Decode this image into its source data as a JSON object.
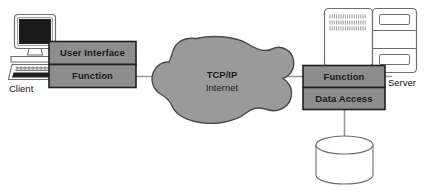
{
  "diagram": {
    "background_color": "#ffffff",
    "colors": {
      "cloud_fill": "#9a9a9a",
      "cloud_stroke": "#4a4a4a",
      "box_fill": "#8d8d8d",
      "box_stroke": "#1f1f1f",
      "line": "#9a9a9a",
      "outline": "#6e6e6e",
      "screen": "#1a1a1a",
      "text": "#111111"
    }
  },
  "client": {
    "label": "Client",
    "icon": "desktop-computer-icon",
    "tiers": [
      {
        "id": "user-interface",
        "label": "User Interface"
      },
      {
        "id": "function",
        "label": "Function"
      }
    ]
  },
  "network": {
    "icon": "cloud-icon",
    "label_line1": "TCP/IP",
    "label_line2": "Internet"
  },
  "server": {
    "label": "Server",
    "icon": "server-tower-icon",
    "tiers": [
      {
        "id": "function",
        "label": "Function"
      },
      {
        "id": "data-access",
        "label": "Data Access"
      }
    ]
  },
  "database": {
    "icon": "database-cylinder-icon",
    "label": ""
  },
  "connections": [
    {
      "id": "client-to-cloud",
      "from": "client-function",
      "to": "cloud"
    },
    {
      "id": "cloud-to-server",
      "from": "cloud",
      "to": "server-function"
    },
    {
      "id": "data-access-to-database",
      "from": "server-data-access",
      "to": "database"
    }
  ]
}
